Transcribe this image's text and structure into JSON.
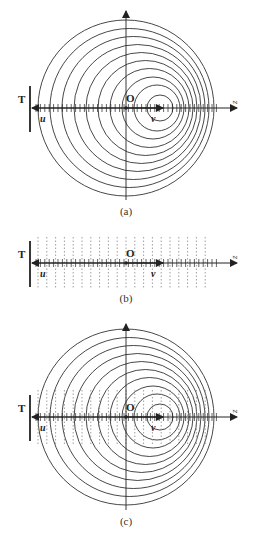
{
  "figure": {
    "panels": [
      {
        "id": "a",
        "caption": "(a)",
        "wall_label": "T",
        "origin_label": "O",
        "axis_label": "z",
        "velocity_left_label": "u",
        "velocity_right_label": "v",
        "shows_circles": true,
        "shows_dashed_lines": false
      },
      {
        "id": "b",
        "caption": "(b)",
        "wall_label": "T",
        "origin_label": "O",
        "axis_label": "z",
        "velocity_left_label": "u",
        "velocity_right_label": "v",
        "shows_circles": false,
        "shows_dashed_lines": true
      },
      {
        "id": "c",
        "caption": "(c)",
        "wall_label": "T",
        "origin_label": "O",
        "axis_label": "z",
        "velocity_left_label": "u",
        "velocity_right_label": "v",
        "shows_circles": true,
        "shows_dashed_lines": true
      }
    ],
    "circles": [
      {
        "dx": 34,
        "r": 13
      },
      {
        "dx": 31,
        "r": 23
      },
      {
        "dx": 27,
        "r": 31
      },
      {
        "dx": 23.5,
        "r": 39.5
      },
      {
        "dx": 19.5,
        "r": 47.5
      },
      {
        "dx": 15.5,
        "r": 55.5
      },
      {
        "dx": 11.5,
        "r": 63.5
      },
      {
        "dx": 7.5,
        "r": 71.5
      },
      {
        "dx": 3.5,
        "r": 79.5
      },
      {
        "dx": 0,
        "r": 88
      }
    ],
    "colors": {
      "line": "#222222",
      "circle": "#333333",
      "dashed": "#888888"
    }
  }
}
